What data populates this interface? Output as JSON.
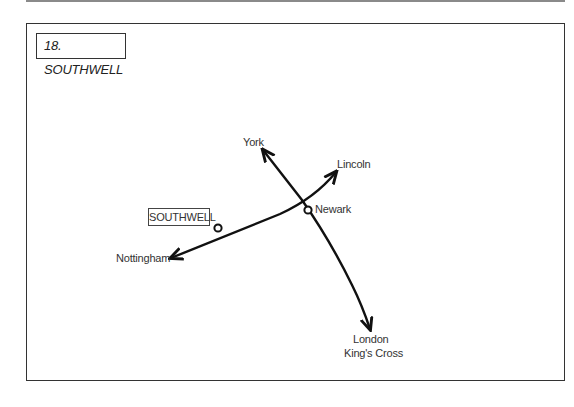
{
  "title": "18. SOUTHWELL",
  "map": {
    "highlighted_town": "SOUTHWELL",
    "stations": {
      "york": "York",
      "lincoln": "Lincoln",
      "newark": "Newark",
      "nottingham": "Nottingham",
      "london_line1": "London",
      "london_line2": "King's Cross"
    }
  },
  "colors": {
    "line": "#111111",
    "frame": "#333333",
    "text": "#333333"
  }
}
